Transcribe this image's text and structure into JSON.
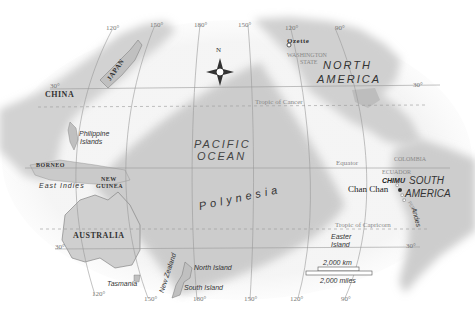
{
  "map": {
    "title": "Pacific Ocean and Polynesia",
    "ocean": {
      "line1": "PACIFIC",
      "line2": "OCEAN"
    },
    "region": "Polynesia",
    "continents": {
      "north_america_1": "NORTH",
      "north_america_2": "AMERICA",
      "south_america_1": "SOUTH",
      "south_america_2": "AMERICA",
      "australia": "AUSTRALIA"
    },
    "countries": {
      "china": "CHINA",
      "japan": "JAPAN",
      "borneo": "BORNEO",
      "new_guinea_1": "NEW",
      "new_guinea_2": "GUINEA",
      "colombia": "COLOMBIA",
      "ecuador": "ECUADOR",
      "peru": "PERU",
      "washington_1": "WASHINGTON",
      "washington_2": "STATE"
    },
    "places": {
      "ozette": "Ozette",
      "chan_chan": "Chan Chan",
      "chimu": "CHIMU",
      "philippine_1": "Philippine",
      "philippine_2": "Islands",
      "east_indies": "East Indies",
      "tasmania": "Tasmania",
      "new_zealand": "New Zealand",
      "north_island": "North Island",
      "south_island": "South Island",
      "easter_1": "Easter",
      "easter_2": "Island",
      "andes": "Andes"
    },
    "lines": {
      "tropic_cancer": "Tropic of Cancer",
      "equator": "Equator",
      "tropic_capricorn": "Tropic of Capricorn"
    },
    "degree_labels": {
      "top_120": "120°",
      "top_150": "150°",
      "top_180": "180°",
      "top_150e": "150°",
      "top_120w": "120°",
      "top_90w": "90°",
      "lat_30_left": "30°",
      "lat_30_right": "30°",
      "lat_30s_left": "30°",
      "lat_30s_right": "30°",
      "bot_120": "120°",
      "bot_150": "150°",
      "bot_180": "180°",
      "bot_150w": "150°",
      "bot_120w": "120°",
      "bot_90w": "90°"
    },
    "compass": {
      "north": "N"
    },
    "scale": {
      "km": "2,000 km",
      "miles": "2,000 miles"
    },
    "colors": {
      "land": "#c9c9c9",
      "land_edge": "#8a8a8a",
      "polynesia": "#bdbdbd",
      "water": "#ffffff",
      "grid": "#9a9a9a"
    }
  }
}
